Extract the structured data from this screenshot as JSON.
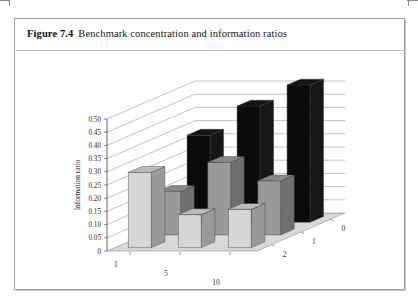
{
  "figure": {
    "label": "Figure 7.4",
    "caption": "Benchmark concentration and information ratios"
  },
  "chart_data": {
    "type": "bar",
    "title": "Benchmark concentration and information ratios",
    "projection": "3d",
    "xlabel": "Tracking error (%)",
    "zlabel": "Concentration index",
    "ylabel": "Information ratio",
    "ylim": [
      0,
      0.5
    ],
    "ytick_labels": [
      "0",
      "0.05",
      "0.10",
      "0.15",
      "0.20",
      "0.25",
      "0.30",
      "0.35",
      "0.40",
      "0.45",
      "0.50"
    ],
    "ytick_values": [
      0,
      0.05,
      0.1,
      0.15,
      0.2,
      0.25,
      0.3,
      0.35,
      0.4,
      0.45,
      0.5
    ],
    "grid": true,
    "legend": "none",
    "categories": [
      "1",
      "5",
      "10"
    ],
    "depth_categories": [
      "0",
      "1",
      "2"
    ],
    "series": [
      {
        "name": "Concentration index 2",
        "row": "back",
        "color": "#0a0a0a",
        "categories": [
          "1",
          "5",
          "10"
        ],
        "values": [
          0.33,
          0.44,
          0.52
        ]
      },
      {
        "name": "Concentration index 1",
        "row": "middle",
        "color": "#9a9a9a",
        "categories": [
          "1",
          "5",
          "10"
        ],
        "values": [
          0.165,
          0.275,
          0.205
        ]
      },
      {
        "name": "Concentration index 0",
        "row": "front",
        "color": "#d6d6d6",
        "categories": [
          "1",
          "5",
          "10"
        ],
        "values": [
          0.285,
          0.125,
          0.145
        ]
      }
    ]
  },
  "colors": {
    "bar_back": "#0a0a0a",
    "bar_middle": "#9a9a9a",
    "bar_front": "#d6d6d6",
    "floor": "#d9d9d9",
    "grid": "#8c8c8c",
    "axis": "#555555",
    "box_border": "#9a9a9a"
  }
}
